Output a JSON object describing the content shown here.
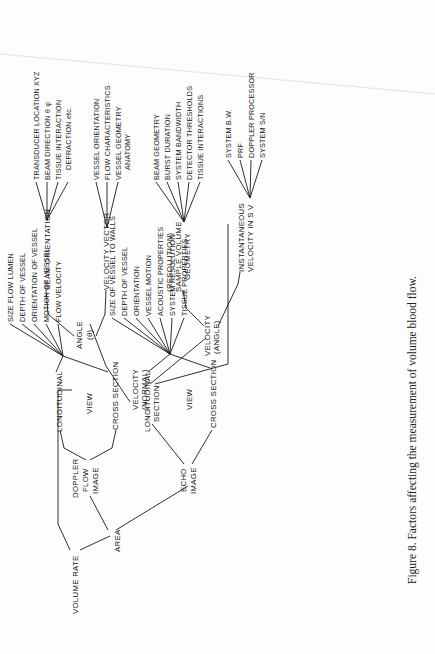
{
  "figure": {
    "caption": "Figure 8.  Factors affecting the measurement of volume blood flow."
  },
  "nodes": {
    "volume_rate": "VOLUME RATE",
    "area": "AREA",
    "velocity_normal": [
      "VELOCITY",
      "(NORMAL)"
    ],
    "angle": [
      "ANGLE",
      "(θ)"
    ],
    "beam_orientation": "BEAM  ORIENTATION",
    "velocity_vector": "VELOCITY  VECTOR",
    "velocity_angle": [
      "VELOCITY",
      "(ANGLE)"
    ],
    "sample_volume": [
      "(RESOLUTION)",
      "SAMPLE  VOLUME",
      "GEOMETRY"
    ],
    "instantaneous_velocity": [
      "INSTANTANEOUS",
      "VELOCITY  IN  S V"
    ],
    "doppler_flow_image": [
      "DOPPLER",
      "FLOW",
      "IMAGE"
    ],
    "doppler_view": "VIEW",
    "doppler_longitudinal": "LONGITUDINAL",
    "doppler_cross_section": "CROSS  SECTION",
    "echo_image": [
      "ECHO",
      "IMAGE"
    ],
    "echo_view": "VIEW",
    "echo_longitudinal": [
      "LONGITUDINAL",
      "SECTION"
    ],
    "echo_cross_section": "CROSS  SECTION"
  },
  "leaves": {
    "beam_orientation": [
      "TRANSDUCER  LOCATION  XYZ",
      "BEAM  DIRECTION  θ φ",
      "TISSUE  INTERACTION",
      "DEFRACTION  etc."
    ],
    "velocity_vector": [
      "VESSEL  ORIENTATION",
      "FLOW  CHARACTERISTICS",
      "VESSEL  GEOMETRY",
      "ANATOMY"
    ],
    "sample_volume": [
      "BEAM  GEOMETRY",
      "BURST  DURATION",
      "SYSTEM  BANDWIDTH",
      "DETECTOR  THRESHOLDS",
      "TISSUE  INTERACTIONS"
    ],
    "instantaneous_velocity": [
      "SYSTEM  B.W.",
      "PRF",
      "DOPPLER  PROCESSOR",
      "SYSTEM  S/N"
    ],
    "doppler_longitudinal": [
      "SIZE FLOW LUMEN",
      "DEPTH  OF  VESSEL",
      "ORIENTATION  OF  VESSEL",
      "MOTION  OF  VESSEL",
      "FLOW  VELOCITY"
    ],
    "echo_longitudinal": [
      "SIZE  OF  VESSEL  TO  WALLS",
      "DEPTH  OF  VESSEL",
      "ORIENTATION",
      "VESSEL  MOTION",
      "ACOUSTIC  PROPERTIES",
      "SYSTEM  RESOLUTION",
      "TISSUE  PROPERTIES"
    ]
  }
}
